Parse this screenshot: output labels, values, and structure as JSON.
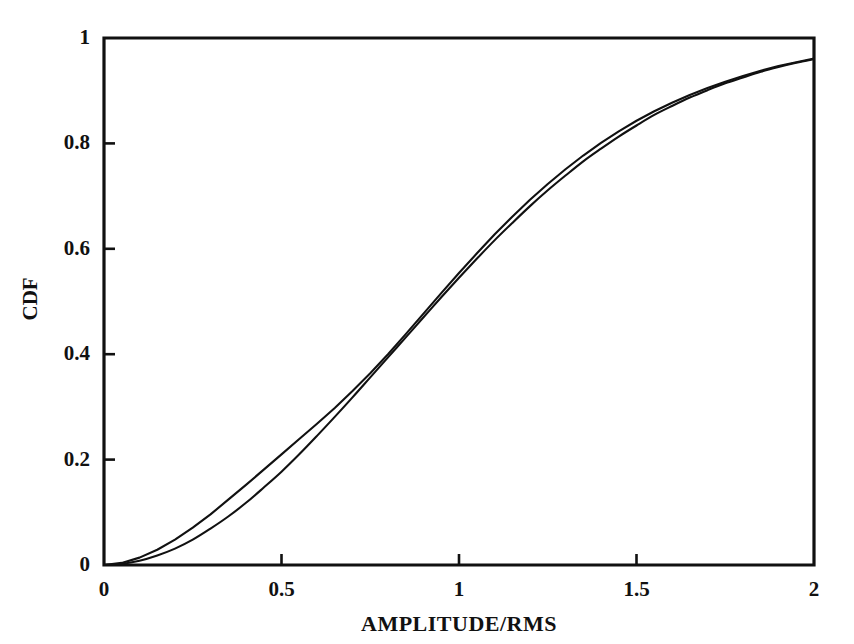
{
  "chart_data": {
    "type": "line",
    "title": "",
    "subtitle": "",
    "xlabel": "AMPLITUDE/RMS",
    "ylabel": "CDF",
    "xlim": [
      0,
      2
    ],
    "ylim": [
      0,
      1
    ],
    "xticks": [
      "0",
      "0.5",
      "1",
      "1.5",
      "2"
    ],
    "xtick_values": [
      0,
      0.5,
      1,
      1.5,
      2
    ],
    "yticks": [
      "0",
      "0.2",
      "0.4",
      "0.6",
      "0.8",
      "1"
    ],
    "ytick_values": [
      0,
      0.2,
      0.4,
      0.6,
      0.8,
      1
    ],
    "grid": false,
    "legend": "none",
    "legend_position": "none",
    "annotations": [],
    "line_color": "#111111",
    "axis_color": "#111111",
    "background_color": "#ffffff",
    "series": [
      {
        "name": "theoretical-cdf",
        "style": "smooth",
        "x": [
          0.0,
          0.05,
          0.1,
          0.15,
          0.2,
          0.25,
          0.3,
          0.35,
          0.4,
          0.45,
          0.5,
          0.55,
          0.6,
          0.65,
          0.7,
          0.75,
          0.8,
          0.85,
          0.9,
          0.95,
          1.0,
          1.05,
          1.1,
          1.15,
          1.2,
          1.25,
          1.3,
          1.35,
          1.4,
          1.45,
          1.5,
          1.55,
          1.6,
          1.65,
          1.7,
          1.75,
          1.8,
          1.85,
          1.9,
          1.95,
          2.0
        ],
        "values": [
          0.0,
          0.002,
          0.008,
          0.018,
          0.031,
          0.048,
          0.069,
          0.092,
          0.118,
          0.147,
          0.177,
          0.21,
          0.245,
          0.281,
          0.318,
          0.356,
          0.394,
          0.432,
          0.47,
          0.508,
          0.545,
          0.581,
          0.616,
          0.649,
          0.681,
          0.711,
          0.739,
          0.766,
          0.79,
          0.813,
          0.834,
          0.854,
          0.871,
          0.887,
          0.901,
          0.914,
          0.925,
          0.936,
          0.945,
          0.953,
          0.96
        ]
      },
      {
        "name": "measured-cdf",
        "style": "piecewise",
        "x": [
          0.0,
          0.05,
          0.1,
          0.15,
          0.2,
          0.25,
          0.3,
          0.35,
          0.4,
          0.45,
          0.5,
          0.55,
          0.6,
          0.65,
          0.7,
          0.75,
          0.8,
          0.85,
          0.9,
          0.95,
          1.0,
          1.05,
          1.1,
          1.15,
          1.2,
          1.25,
          1.3,
          1.35,
          1.4,
          1.45,
          1.5,
          1.55,
          1.6,
          1.65,
          1.7,
          1.75,
          1.8,
          1.85,
          1.9,
          1.95,
          2.0
        ],
        "values": [
          0.0,
          0.004,
          0.014,
          0.029,
          0.048,
          0.071,
          0.096,
          0.124,
          0.152,
          0.181,
          0.21,
          0.239,
          0.268,
          0.298,
          0.33,
          0.364,
          0.4,
          0.438,
          0.477,
          0.516,
          0.554,
          0.591,
          0.627,
          0.661,
          0.693,
          0.723,
          0.751,
          0.777,
          0.801,
          0.823,
          0.843,
          0.861,
          0.877,
          0.892,
          0.905,
          0.917,
          0.928,
          0.938,
          0.947,
          0.954,
          0.961
        ]
      }
    ]
  },
  "axes": {
    "x_tick_labels": [
      "0",
      "0.5",
      "1",
      "1.5",
      "2"
    ],
    "y_tick_labels": [
      "0",
      "0.2",
      "0.4",
      "0.6",
      "0.8",
      "1"
    ],
    "x_axis_title": "AMPLITUDE/RMS",
    "y_axis_title": "CDF"
  }
}
